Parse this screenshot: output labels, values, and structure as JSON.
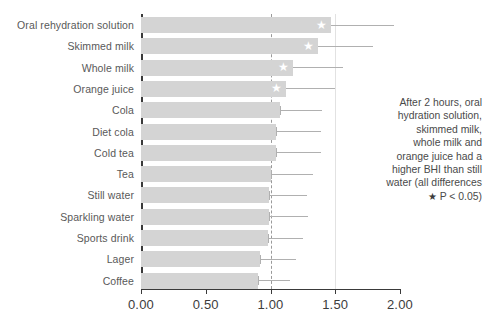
{
  "chart_data": {
    "type": "bar",
    "orientation": "horizontal",
    "title": "",
    "xlabel": "",
    "ylabel": "",
    "xlim": [
      0.0,
      2.0
    ],
    "grid": true,
    "gridlines": [
      1.5
    ],
    "reference_line": 1.0,
    "tick_labels": [
      "0.00",
      "0.50",
      "1.00",
      "1.50",
      "2.00"
    ],
    "tick_values": [
      0.0,
      0.5,
      1.0,
      1.5,
      2.0
    ],
    "categories": [
      "Oral rehydration solution",
      "Skimmed milk",
      "Whole milk",
      "Orange juice",
      "Cola",
      "Diet cola",
      "Cold tea",
      "Tea",
      "Still water",
      "Sparkling water",
      "Sports drink",
      "Lager",
      "Coffee"
    ],
    "values": [
      1.47,
      1.37,
      1.17,
      1.12,
      1.07,
      1.04,
      1.04,
      1.0,
      0.99,
      0.99,
      0.98,
      0.92,
      0.9
    ],
    "error_high": [
      1.95,
      1.79,
      1.56,
      1.5,
      1.4,
      1.39,
      1.39,
      1.33,
      1.28,
      1.29,
      1.25,
      1.2,
      1.15
    ],
    "significant": [
      true,
      true,
      true,
      true,
      false,
      false,
      false,
      false,
      false,
      false,
      false,
      false,
      false
    ],
    "star_marker": "★",
    "colors": {
      "bar": "#d4d4d4",
      "error": "#b0b0b0",
      "axis": "#3a3a3a",
      "gridline": "#e2e2e2",
      "reference_line": "#9a9a9a",
      "star": "#ffffff",
      "text": "#595959"
    }
  },
  "annotation": {
    "lines": [
      "After 2 hours, oral",
      "hydration solution,",
      "skimmed milk,",
      "whole milk and",
      "orange juice had a",
      "higher BHI than still",
      "water (all differences"
    ],
    "star_line_marker": "★",
    "star_line_text": "P < 0.05)"
  }
}
